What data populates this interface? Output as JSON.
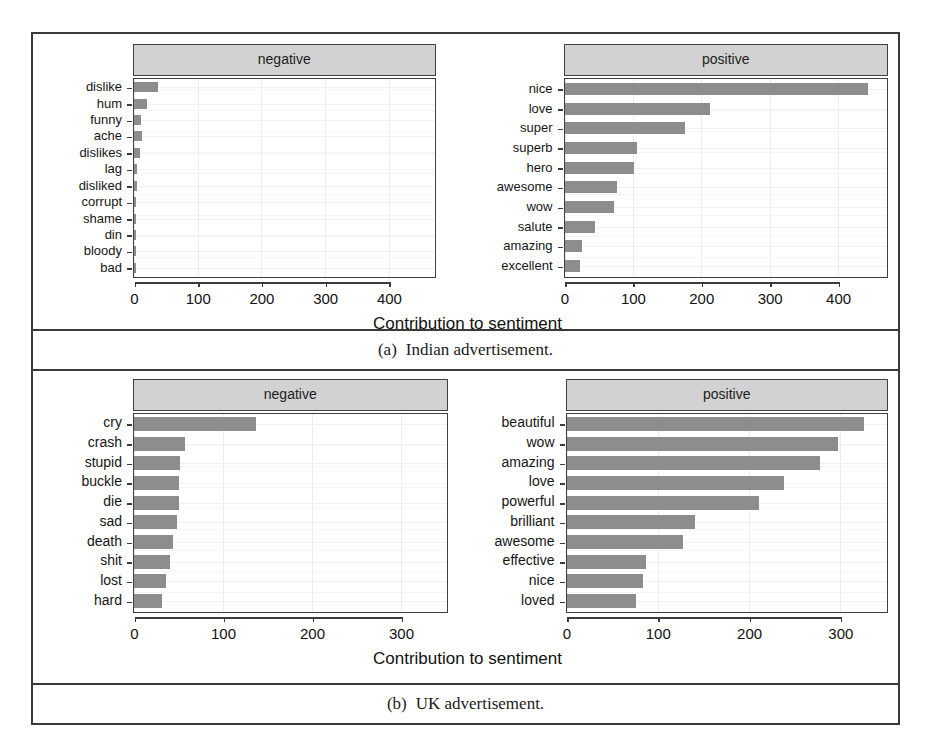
{
  "figure": {
    "subfigures": [
      {
        "id": "a",
        "caption_number": "(a)",
        "caption_text": "Indian advertisement.",
        "axis_title": "Contribution to sentiment"
      },
      {
        "id": "b",
        "caption_number": "(b)",
        "caption_text": "UK advertisement.",
        "axis_title": "Contribution to sentiment"
      }
    ]
  },
  "chart_data": [
    {
      "type": "bar",
      "orientation": "horizontal",
      "title": "Indian advertisement.",
      "panel": "negative",
      "strip_label": "negative",
      "xlabel": "Contribution to sentiment",
      "ylabel": "",
      "xlim": [
        0,
        470
      ],
      "xticks": [
        0,
        100,
        200,
        300,
        400
      ],
      "xtick_labels": [
        "0",
        "100",
        "200",
        "300",
        "400"
      ],
      "grid": true,
      "categories": [
        "dislike",
        "hum",
        "funny",
        "ache",
        "dislikes",
        "lag",
        "disliked",
        "corrupt",
        "shame",
        "din",
        "bloody",
        "bad"
      ],
      "values": [
        38,
        20,
        11,
        12,
        9,
        5,
        4,
        3,
        3,
        2,
        2,
        2
      ]
    },
    {
      "type": "bar",
      "orientation": "horizontal",
      "title": "Indian advertisement.",
      "panel": "positive",
      "strip_label": "positive",
      "xlabel": "Contribution to sentiment",
      "ylabel": "",
      "xlim": [
        0,
        470
      ],
      "xticks": [
        0,
        100,
        200,
        300,
        400
      ],
      "xtick_labels": [
        "0",
        "100",
        "200",
        "300",
        "400"
      ],
      "grid": true,
      "categories": [
        "nice",
        "love",
        "super",
        "superb",
        "hero",
        "awesome",
        "wow",
        "salute",
        "amazing",
        "excellent"
      ],
      "values": [
        443,
        213,
        176,
        106,
        101,
        77,
        72,
        44,
        25,
        23
      ]
    },
    {
      "type": "bar",
      "orientation": "horizontal",
      "title": "UK advertisement.",
      "panel": "negative",
      "strip_label": "negative",
      "xlabel": "Contribution to sentiment",
      "ylabel": "",
      "xlim": [
        0,
        350
      ],
      "xticks": [
        0,
        100,
        200,
        300
      ],
      "xtick_labels": [
        "0",
        "100",
        "200",
        "300"
      ],
      "grid": true,
      "categories": [
        "cry",
        "crash",
        "stupid",
        "buckle",
        "die",
        "sad",
        "death",
        "shit",
        "lost",
        "hard"
      ],
      "values": [
        137,
        57,
        52,
        50,
        50,
        48,
        44,
        41,
        36,
        32
      ]
    },
    {
      "type": "bar",
      "orientation": "horizontal",
      "title": "UK advertisement.",
      "panel": "positive",
      "strip_label": "positive",
      "xlabel": "Contribution to sentiment",
      "ylabel": "",
      "xlim": [
        0,
        350
      ],
      "xticks": [
        0,
        100,
        200,
        300
      ],
      "xtick_labels": [
        "0",
        "100",
        "200",
        "300"
      ],
      "grid": true,
      "categories": [
        "beautiful",
        "wow",
        "amazing",
        "love",
        "powerful",
        "brilliant",
        "awesome",
        "effective",
        "nice",
        "loved"
      ],
      "values": [
        326,
        297,
        278,
        238,
        211,
        141,
        128,
        87,
        84,
        76
      ]
    }
  ],
  "colors": {
    "bar_fill": "#8d8d8d",
    "strip_fill": "#d2d2d2",
    "frame": "#3a3a3a",
    "panel_border": "#404040",
    "gridline": "#ededed",
    "text": "#111111"
  }
}
